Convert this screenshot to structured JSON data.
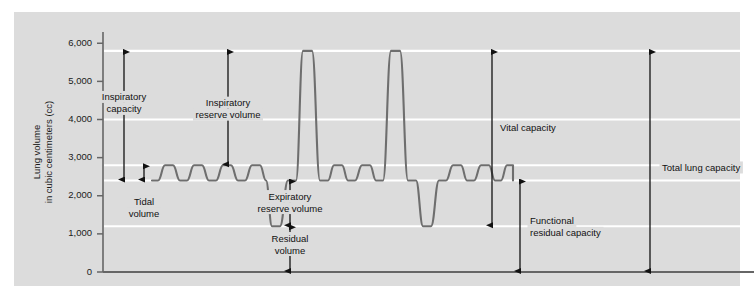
{
  "figure": {
    "background_color": "#ffffff",
    "panel_color": "#dcdcdc",
    "gridline_color": "#ffffff",
    "axis_color": "#666666",
    "trace_color": "#6e6e6e",
    "arrow_color": "#111111",
    "text_color": "#111111"
  },
  "axis": {
    "y_title_line1": "Lung volume",
    "y_title_line2": "in cubic centimeters (cc)",
    "y_ticks": [
      "6,000",
      "5,000",
      "4,000",
      "3,000",
      "2,000",
      "1,000",
      "0"
    ],
    "y_tick_values": [
      6000,
      5000,
      4000,
      3000,
      2000,
      1000,
      0
    ],
    "y_min": 0,
    "y_max": 6400,
    "x_axis_label": ""
  },
  "annotations": [
    {
      "name": "inspiratory-capacity",
      "label_line1": "Inspiratory",
      "label_line2": "capacity",
      "from_value": 5800,
      "to_value": 2400,
      "x": 124,
      "label_x": 124,
      "label_y_value": 4500,
      "align": "mid",
      "arrow": "both"
    },
    {
      "name": "tidal-volume",
      "label_line1": "Tidal",
      "label_line2": "volume",
      "from_value": 2800,
      "to_value": 2400,
      "x": 144,
      "label_x": 144,
      "label_y_value": 1750,
      "align": "mid",
      "arrow": "both"
    },
    {
      "name": "inspiratory-reserve-volume",
      "label_line1": "Inspiratory",
      "label_line2": "reserve volume",
      "from_value": 5800,
      "to_value": 2800,
      "x": 228,
      "label_x": 228,
      "label_y_value": 4350,
      "align": "mid",
      "arrow": "both"
    },
    {
      "name": "expiratory-reserve-volume",
      "label_line1": "Expiratory",
      "label_line2": "reserve volume",
      "from_value": 2400,
      "to_value": 1200,
      "x": 290,
      "label_x": 290,
      "label_y_value": 1900,
      "align": "mid",
      "arrow": "both"
    },
    {
      "name": "residual-volume",
      "label_line1": "Residual",
      "label_line2": "volume",
      "from_value": 1200,
      "to_value": 0,
      "x": 290,
      "label_x": 290,
      "label_y_value": 800,
      "align": "mid",
      "arrow": "both"
    },
    {
      "name": "vital-capacity",
      "label_line1": "Vital capacity",
      "label_line2": "",
      "from_value": 5800,
      "to_value": 1200,
      "x": 492,
      "label_x": 500,
      "label_y_value": 3700,
      "align": "start",
      "arrow": "both"
    },
    {
      "name": "functional-residual-capacity",
      "label_line1": "Functional",
      "label_line2": "residual capacity",
      "from_value": 2400,
      "to_value": 0,
      "x": 520,
      "label_x": 530,
      "label_y_value": 1250,
      "align": "start",
      "arrow": "both"
    },
    {
      "name": "total-lung-capacity",
      "label_line1": "Total lung capacity",
      "label_line2": "",
      "from_value": 5800,
      "to_value": 0,
      "x": 650,
      "label_x": 662,
      "label_y_value": 2650,
      "align": "start",
      "arrow": "both"
    }
  ],
  "chart_data": {
    "type": "line",
    "title": "",
    "xlabel": "",
    "ylabel": "Lung volume in cubic centimeters (cc)",
    "ylim": [
      0,
      6400
    ],
    "y_ticks": [
      0,
      1000,
      2000,
      3000,
      4000,
      5000,
      6000
    ],
    "grid": true,
    "legend": "none",
    "reference_levels": {
      "tidal_peak": 2800,
      "tidal_trough": 2400,
      "maximal_inspiration": 5800,
      "maximal_expiration": 1200,
      "residual_volume": 1200,
      "functional_residual_capacity": 2400,
      "total_lung_capacity": 5800
    },
    "volumes": {
      "tidal_volume": 400,
      "inspiratory_reserve_volume": 3000,
      "expiratory_reserve_volume": 1200,
      "residual_volume": 1200,
      "inspiratory_capacity": 3400,
      "vital_capacity": 4600,
      "functional_residual_capacity": 2400,
      "total_lung_capacity": 5800
    },
    "series": [
      {
        "name": "spirogram",
        "points": [
          [
            152,
            2400
          ],
          [
            158,
            2400
          ],
          [
            165,
            2800
          ],
          [
            173,
            2800
          ],
          [
            180,
            2400
          ],
          [
            187,
            2400
          ],
          [
            194,
            2800
          ],
          [
            202,
            2800
          ],
          [
            209,
            2400
          ],
          [
            216,
            2400
          ],
          [
            223,
            2800
          ],
          [
            231,
            2800
          ],
          [
            238,
            2400
          ],
          [
            245,
            2400
          ],
          [
            252,
            2800
          ],
          [
            260,
            2800
          ],
          [
            266,
            2400
          ],
          [
            272,
            1200
          ],
          [
            280,
            1200
          ],
          [
            288,
            2400
          ],
          [
            296,
            2400
          ],
          [
            303,
            5800
          ],
          [
            312,
            5800
          ],
          [
            320,
            2400
          ],
          [
            328,
            2400
          ],
          [
            334,
            2800
          ],
          [
            342,
            2800
          ],
          [
            348,
            2400
          ],
          [
            355,
            2400
          ],
          [
            362,
            2800
          ],
          [
            370,
            2800
          ],
          [
            376,
            2400
          ],
          [
            383,
            2400
          ],
          [
            391,
            5800
          ],
          [
            400,
            5800
          ],
          [
            408,
            2400
          ],
          [
            416,
            2400
          ],
          [
            423,
            1200
          ],
          [
            431,
            1200
          ],
          [
            439,
            2400
          ],
          [
            446,
            2400
          ],
          [
            453,
            2800
          ],
          [
            461,
            2800
          ],
          [
            467,
            2400
          ],
          [
            474,
            2400
          ],
          [
            481,
            2800
          ],
          [
            489,
            2800
          ],
          [
            495,
            2400
          ],
          [
            501,
            2400
          ],
          [
            507,
            2800
          ],
          [
            513,
            2800
          ],
          [
            513,
            2400
          ]
        ]
      }
    ]
  }
}
